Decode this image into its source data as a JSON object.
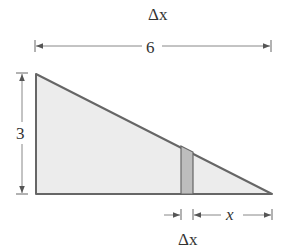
{
  "diagram": {
    "type": "right-triangle-with-strip",
    "labels": {
      "top_delta": "Δx",
      "width": "6",
      "height": "3",
      "x": "x",
      "bottom_delta": "Δx"
    },
    "colors": {
      "outline": "#666666",
      "fill": "#ececec",
      "strip_fill": "#bdbdbd",
      "dimension_line": "#7a7a7a",
      "text": "#333333"
    }
  }
}
